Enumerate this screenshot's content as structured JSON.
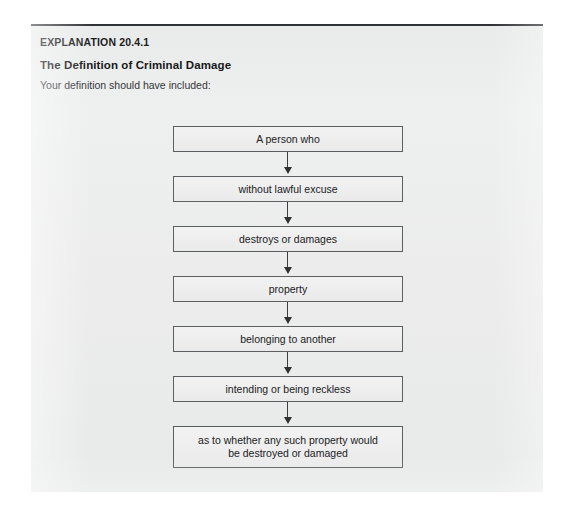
{
  "card": {
    "background_color": "#eceded",
    "top_rule_color": "#2f3234"
  },
  "header": {
    "eyebrow": "EXPLANATION 20.4.1",
    "title": "The Definition of Criminal Damage",
    "lead": "Your definition should have included:"
  },
  "flowchart": {
    "orientation": "vertical",
    "box_border_color": "#5c5f62",
    "box_fill_color": "#efefef",
    "arrow_color": "#2f3133",
    "nodes": [
      {
        "label": "A person who",
        "lines": 1
      },
      {
        "label": "without lawful excuse",
        "lines": 1
      },
      {
        "label": "destroys or damages",
        "lines": 1
      },
      {
        "label": "property",
        "lines": 1
      },
      {
        "label": "belonging to another",
        "lines": 1
      },
      {
        "label": "intending or being reckless",
        "lines": 1
      },
      {
        "label": "as to whether any such property would be destroyed or damaged",
        "lines": 2,
        "line1": "as to whether any such property would",
        "line2": "be destroyed or damaged"
      }
    ],
    "connector_icon": "down-arrow-icon",
    "connector_count": 6
  }
}
